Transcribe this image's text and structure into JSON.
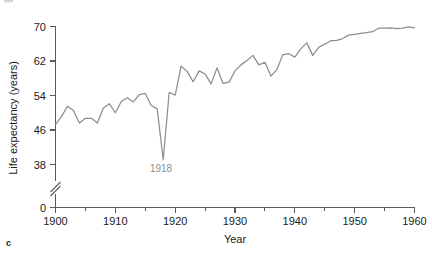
{
  "figure": {
    "panel_label": "c",
    "background_color": "#ffffff",
    "line_color": "#8d8d8d",
    "axis_color": "#5a5a5a",
    "annotation_color": "#8e8e8e",
    "text_color": "#1a1a1a"
  },
  "chart_data": {
    "type": "line",
    "title": "",
    "subtitle": "",
    "xlabel": "Year",
    "ylabel": "Life expectancy (years)",
    "xlim": [
      1900,
      1960
    ],
    "ylim": [
      38,
      70
    ],
    "y_axis_break": true,
    "y_axis_break_from": 0,
    "y_axis_break_to": 38,
    "grid": false,
    "legend": false,
    "legend_position": "none",
    "xticks": [
      1900,
      1910,
      1920,
      1930,
      1940,
      1950,
      1960
    ],
    "xtick_labels": [
      "1900",
      "1910",
      "1920",
      "1930",
      "1940",
      "1950",
      "1960"
    ],
    "xticks_minor": [
      1905,
      1915,
      1925,
      1935,
      1945,
      1955
    ],
    "yticks": [
      0,
      38,
      46,
      54,
      62,
      70
    ],
    "ytick_labels": [
      "0",
      "38",
      "46",
      "54",
      "62",
      "70"
    ],
    "annotations": [
      {
        "text": "1918",
        "x": 1918,
        "y": 39.1,
        "note": "influenza pandemic trough"
      }
    ],
    "series": [
      {
        "name": "Life expectancy",
        "color": "#8d8d8d",
        "x": [
          1900,
          1901,
          1902,
          1903,
          1904,
          1905,
          1906,
          1907,
          1908,
          1909,
          1910,
          1911,
          1912,
          1913,
          1914,
          1915,
          1916,
          1917,
          1918,
          1919,
          1920,
          1921,
          1922,
          1923,
          1924,
          1925,
          1926,
          1927,
          1928,
          1929,
          1930,
          1931,
          1932,
          1933,
          1934,
          1935,
          1936,
          1937,
          1938,
          1939,
          1940,
          1941,
          1942,
          1943,
          1944,
          1945,
          1946,
          1947,
          1948,
          1949,
          1950,
          1951,
          1952,
          1953,
          1954,
          1955,
          1956,
          1957,
          1958,
          1959,
          1960
        ],
        "values": [
          47.3,
          49.1,
          51.5,
          50.5,
          47.6,
          48.7,
          48.7,
          47.6,
          51.1,
          52.1,
          50.0,
          52.6,
          53.5,
          52.5,
          54.2,
          54.5,
          51.7,
          50.9,
          39.1,
          54.7,
          54.1,
          60.8,
          59.6,
          57.2,
          59.7,
          59.0,
          56.7,
          60.4,
          56.8,
          57.1,
          59.7,
          61.1,
          62.1,
          63.3,
          61.1,
          61.7,
          58.5,
          60.0,
          63.5,
          63.7,
          62.9,
          64.8,
          66.2,
          63.3,
          65.2,
          65.9,
          66.7,
          66.8,
          67.2,
          68.0,
          68.2,
          68.4,
          68.6,
          68.8,
          69.6,
          69.6,
          69.7,
          69.5,
          69.6,
          69.9,
          69.7
        ]
      }
    ]
  }
}
